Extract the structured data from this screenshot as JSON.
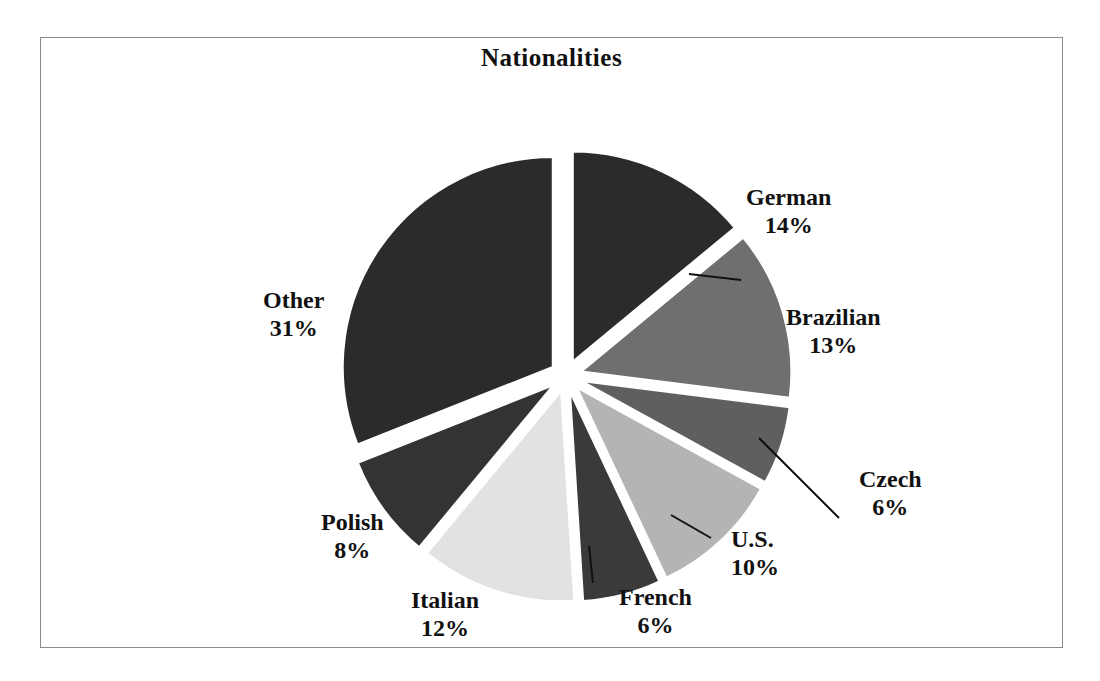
{
  "chart": {
    "title": "Nationalities",
    "frame_border_color": "#8a8a8a",
    "background": "#ffffff"
  },
  "chart_data": {
    "type": "pie",
    "title": "Nationalities",
    "exploded": true,
    "start_angle_deg": 0,
    "direction": "clockwise",
    "categories": [
      "German",
      "Brazilian",
      "Czech",
      "U.S.",
      "French",
      "Italian",
      "Polish",
      "Other"
    ],
    "values": [
      14,
      13,
      6,
      10,
      6,
      12,
      8,
      31
    ],
    "value_unit": "%",
    "labels": [
      "German 14%",
      "Brazilian 13%",
      "Czech 6%",
      "U.S. 10%",
      "French 6%",
      "Italian 12%",
      "Polish 8%",
      "Other 31%"
    ],
    "colors": [
      "#2b2b2b",
      "#6f6f6f",
      "#5f5f5f",
      "#b4b4b4",
      "#3a3a3a",
      "#e2e2e2",
      "#333333",
      "#2b2b2b"
    ],
    "legend": "none",
    "data_labels": "outside",
    "slices": [
      {
        "name": "German",
        "pct_text": "14%",
        "value": 14,
        "color": "#2b2b2b",
        "leader_line": true
      },
      {
        "name": "Brazilian",
        "pct_text": "13%",
        "value": 13,
        "color": "#6f6f6f",
        "leader_line": false
      },
      {
        "name": "Czech",
        "pct_text": "6%",
        "value": 6,
        "color": "#5f5f5f",
        "leader_line": true
      },
      {
        "name": "U.S.",
        "pct_text": "10%",
        "value": 10,
        "color": "#b4b4b4",
        "leader_line": true
      },
      {
        "name": "French",
        "pct_text": "6%",
        "value": 6,
        "color": "#3a3a3a",
        "leader_line": true
      },
      {
        "name": "Italian",
        "pct_text": "12%",
        "value": 12,
        "color": "#e2e2e2",
        "leader_line": false
      },
      {
        "name": "Polish",
        "pct_text": "8%",
        "value": 8,
        "color": "#333333",
        "leader_line": false
      },
      {
        "name": "Other",
        "pct_text": "31%",
        "value": 31,
        "color": "#2b2b2b",
        "leader_line": false
      }
    ]
  }
}
